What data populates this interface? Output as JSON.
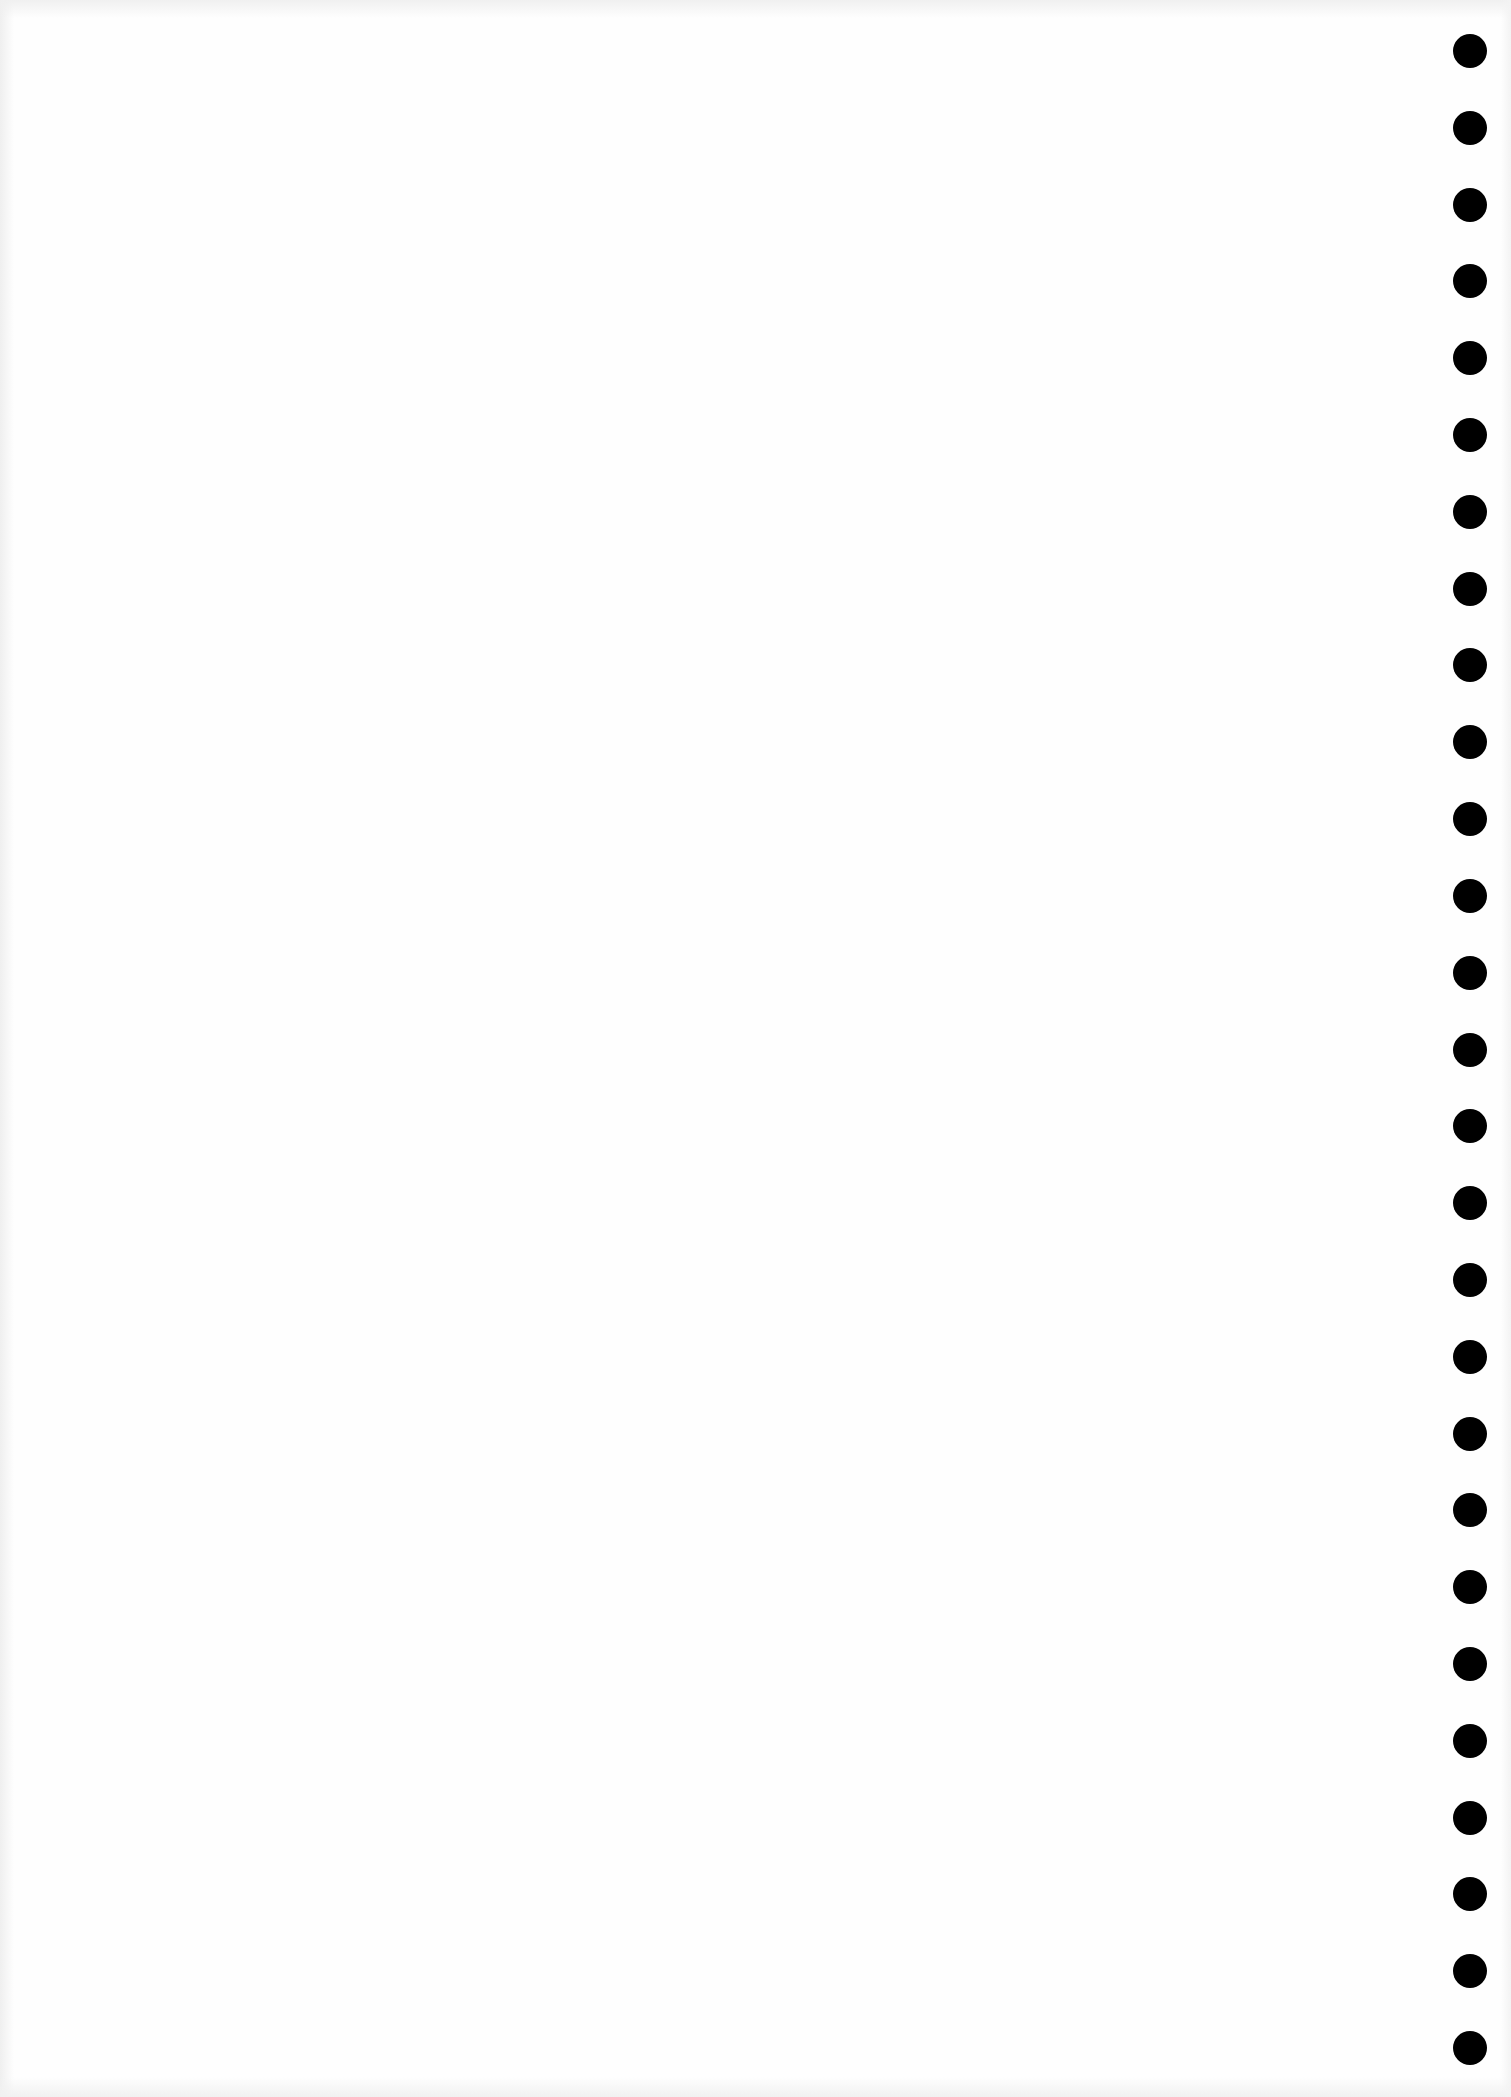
{
  "page": {
    "type": "blank-notebook-page",
    "background_color": "#fefefe",
    "content_text": ""
  },
  "binding": {
    "side": "right",
    "hole_color": "#000000",
    "hole_count": 27,
    "hole_diameter": 34,
    "hole_center_x": 1470,
    "first_hole_center_y": 51,
    "last_hole_center_y": 2048
  }
}
